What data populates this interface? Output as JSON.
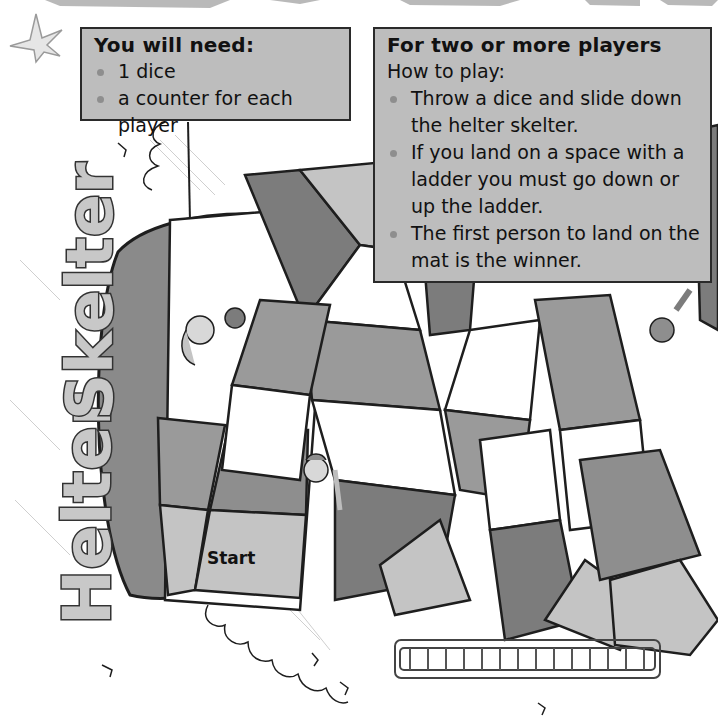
{
  "game": {
    "title_word_1": "Helter",
    "title_word_2": "Skelter",
    "board_start_label": "Start",
    "goal_label": "mat",
    "decorations": [
      "starfish-icon",
      "child-sliding-1",
      "child-sliding-2",
      "child-sliding-3",
      "clouds",
      "birds"
    ]
  },
  "requirements": {
    "heading": "You will need:",
    "items": [
      "1 dice",
      "a counter for each player"
    ]
  },
  "rules": {
    "heading": "For two or more players",
    "subheading": "How to play:",
    "items": [
      "Throw a dice and slide down the helter skelter.",
      "If you land on a space with a ladder you must go down or up the ladder.",
      "The first person to land on the mat is the winner."
    ]
  },
  "colors": {
    "panel_bg": "#bdbdbd",
    "dark_grey": "#7c7c7c",
    "mid_grey": "#9a9a9a",
    "light_grey": "#c4c4c4",
    "white": "#ffffff",
    "outline": "#1e1e1e"
  }
}
